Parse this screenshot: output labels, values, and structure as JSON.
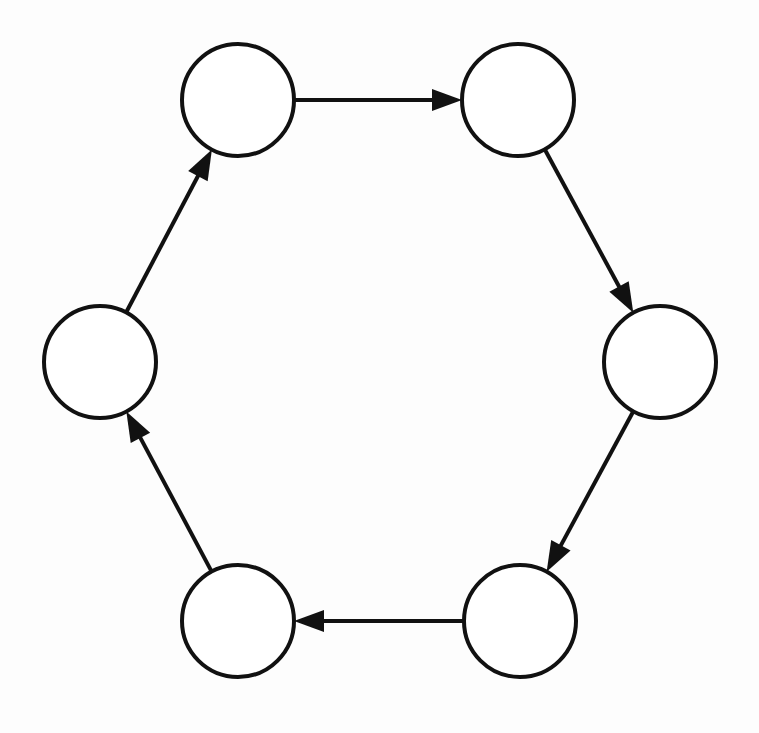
{
  "diagram": {
    "type": "directed-cycle-graph",
    "stroke_color": "#111111",
    "background": "#fdfdfd",
    "node_radius": 56,
    "nodes": [
      {
        "id": "n1",
        "position": "top-left",
        "cx": 238,
        "cy": 100,
        "label": ""
      },
      {
        "id": "n2",
        "position": "top-right",
        "cx": 518,
        "cy": 100,
        "label": ""
      },
      {
        "id": "n3",
        "position": "right",
        "cx": 660,
        "cy": 362,
        "label": ""
      },
      {
        "id": "n4",
        "position": "bottom-right",
        "cx": 520,
        "cy": 621,
        "label": ""
      },
      {
        "id": "n5",
        "position": "bottom-left",
        "cx": 238,
        "cy": 621,
        "label": ""
      },
      {
        "id": "n6",
        "position": "left",
        "cx": 100,
        "cy": 362,
        "label": ""
      }
    ],
    "edges": [
      {
        "from": "n1",
        "to": "n2"
      },
      {
        "from": "n2",
        "to": "n3"
      },
      {
        "from": "n3",
        "to": "n4"
      },
      {
        "from": "n4",
        "to": "n5"
      },
      {
        "from": "n5",
        "to": "n6"
      },
      {
        "from": "n6",
        "to": "n1"
      }
    ]
  }
}
